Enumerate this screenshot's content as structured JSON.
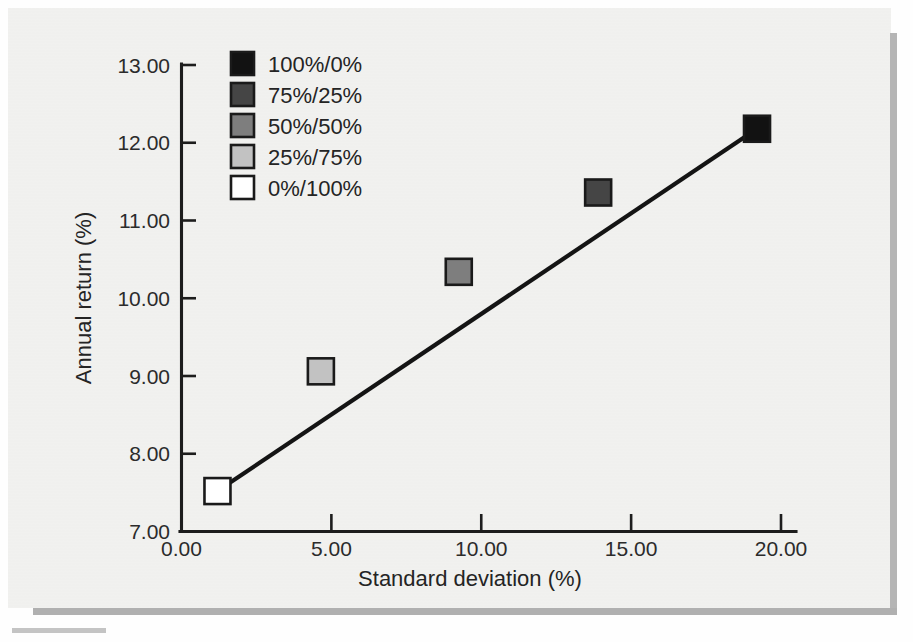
{
  "chart_data": {
    "type": "scatter",
    "title": "",
    "xlabel": "Standard deviation (%)",
    "ylabel": "Annual return (%)",
    "xlim": [
      0.0,
      20.0
    ],
    "ylim": [
      7.0,
      13.0
    ],
    "xticks": [
      "0.00",
      "5.00",
      "10.00",
      "15.00",
      "20.00"
    ],
    "xtick_values": [
      0.0,
      5.0,
      10.0,
      15.0,
      20.0
    ],
    "yticks": [
      "7.00",
      "8.00",
      "9.00",
      "10.00",
      "11.00",
      "12.00",
      "13.00"
    ],
    "ytick_values": [
      7.0,
      8.0,
      9.0,
      10.0,
      11.0,
      12.0,
      13.0
    ],
    "grid": false,
    "legend_position": "top-left",
    "legend_title": "",
    "series": [
      {
        "name": "100%/0%",
        "label": "100%/0%",
        "color": "#121212",
        "x": 19.2,
        "y": 12.18
      },
      {
        "name": "75%/25%",
        "label": "75%/25%",
        "color": "#454545",
        "x": 13.9,
        "y": 11.36
      },
      {
        "name": "50%/50%",
        "label": "50%/50%",
        "color": "#7e7e7e",
        "x": 9.25,
        "y": 10.34
      },
      {
        "name": "25%/75%",
        "label": "25%/75%",
        "color": "#c2c2c2",
        "x": 4.65,
        "y": 9.06
      },
      {
        "name": "0%/100%",
        "label": "0%/100%",
        "color": "#ffffff",
        "x": 1.2,
        "y": 7.52
      }
    ],
    "trendline": {
      "label": "trend-line",
      "x_start": 1.2,
      "y_start": 7.52,
      "x_end": 19.2,
      "y_end": 12.18,
      "color": "#141414"
    },
    "annotations": []
  },
  "colors": {
    "paper": "#f3f3f1",
    "axis": "#1d1d1d",
    "text": "#242424",
    "shadow": "#b5b5b5"
  }
}
